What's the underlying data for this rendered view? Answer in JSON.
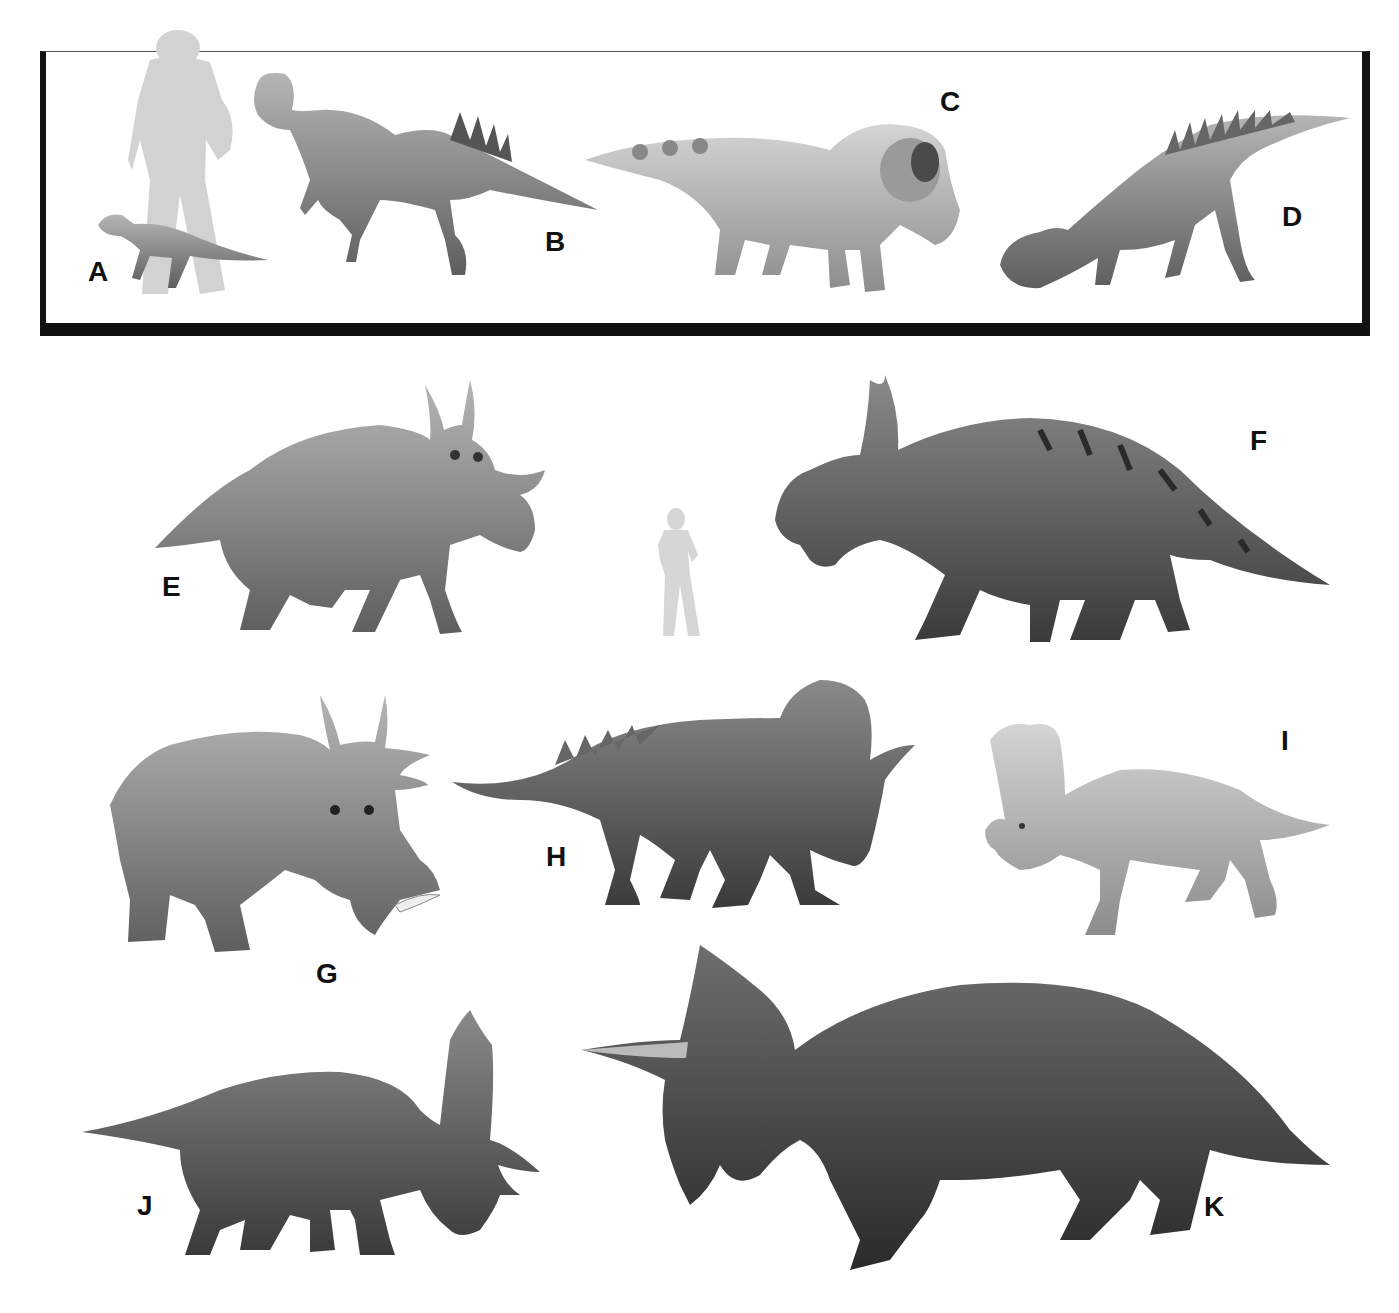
{
  "figure": {
    "inset": {
      "panels": [
        {
          "label": "A",
          "x": 88,
          "y": 258
        },
        {
          "label": "B",
          "x": 545,
          "y": 228
        },
        {
          "label": "C",
          "x": 940,
          "y": 88
        },
        {
          "label": "D",
          "x": 1282,
          "y": 203
        }
      ],
      "scale_figure": "human-silhouette-large"
    },
    "panels": [
      {
        "label": "E",
        "x": 162,
        "y": 573
      },
      {
        "label": "F",
        "x": 1250,
        "y": 427
      },
      {
        "label": "G",
        "x": 316,
        "y": 960
      },
      {
        "label": "H",
        "x": 546,
        "y": 843
      },
      {
        "label": "I",
        "x": 1281,
        "y": 727
      },
      {
        "label": "J",
        "x": 137,
        "y": 1192
      },
      {
        "label": "K",
        "x": 1204,
        "y": 1193
      }
    ],
    "scale_figure": "human-silhouette-small",
    "colors": {
      "frame": "#111111",
      "silhouette": "#d2d2d2",
      "background": "#ffffff"
    }
  }
}
